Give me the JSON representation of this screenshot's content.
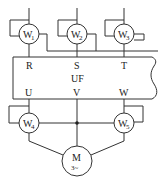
{
  "diagram": {
    "type": "circuit",
    "converter": {
      "label": "UF"
    },
    "inputs": [
      {
        "terminal": "R",
        "meter": "W",
        "meter_sub": "1"
      },
      {
        "terminal": "S",
        "meter": "W",
        "meter_sub": "2"
      },
      {
        "terminal": "T",
        "meter": "W",
        "meter_sub": "3"
      }
    ],
    "outputs": [
      {
        "terminal": "U",
        "meter": "W",
        "meter_sub": "4"
      },
      {
        "terminal": "V"
      },
      {
        "terminal": "W",
        "meter": "W",
        "meter_sub": "5"
      }
    ],
    "motor": {
      "label": "M",
      "sub": "3~"
    }
  }
}
